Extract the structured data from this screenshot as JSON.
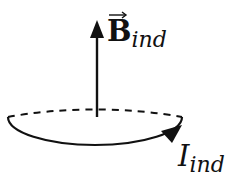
{
  "diagram": {
    "field_label": {
      "symbol": "B",
      "subscript": "ind",
      "vector": true
    },
    "current_label": {
      "symbol": "I",
      "subscript": "ind"
    },
    "colors": {
      "stroke": "#111111",
      "background": "#ffffff"
    },
    "elements": [
      "vertical arrow representing induced magnetic field pointing up",
      "current loop ellipse, back half dashed, front half solid",
      "arrowhead on loop indicating current direction"
    ]
  }
}
